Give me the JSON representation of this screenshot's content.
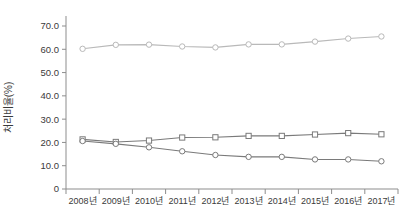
{
  "chart_data": {
    "type": "line",
    "title": "",
    "xlabel": "",
    "ylabel": "처리비율(%)",
    "categories": [
      "2008년",
      "2009년",
      "2010년",
      "2011년",
      "2012년",
      "2013년",
      "2014년",
      "2015년",
      "2016년",
      "2017년"
    ],
    "ylim": [
      0,
      75
    ],
    "yticks": [
      0,
      10,
      20,
      30,
      40,
      50,
      60,
      70
    ],
    "ytick_labels": [
      "0",
      "10.0",
      "20.0",
      "30.0",
      "40.0",
      "50.0",
      "60.0",
      "70.0"
    ],
    "grid": false,
    "legend": "none",
    "series": [
      {
        "name": "series-1",
        "marker": "circle",
        "color": "#b9b9b9",
        "values": [
          60.2,
          61.9,
          62.0,
          61.2,
          60.8,
          62.1,
          62.1,
          63.3,
          64.6,
          65.5
        ]
      },
      {
        "name": "series-2",
        "marker": "square",
        "color": "#7a7a7a",
        "values": [
          21.3,
          20.2,
          20.8,
          22.1,
          22.2,
          22.8,
          22.8,
          23.4,
          24.0,
          23.5
        ]
      },
      {
        "name": "series-3",
        "marker": "circle",
        "color": "#7a7a7a",
        "values": [
          20.6,
          19.4,
          17.9,
          16.2,
          14.6,
          13.8,
          13.8,
          12.7,
          12.7,
          11.9
        ]
      }
    ]
  },
  "axes": {
    "y_title": "처리비율(%)",
    "y_tick_labels": [
      "70.0",
      "60.0",
      "50.0",
      "40.0",
      "30.0",
      "20.0",
      "10.0",
      "0"
    ],
    "x_tick_labels": [
      "2008년",
      "2009년",
      "2010년",
      "2011년",
      "2012년",
      "2013년",
      "2014년",
      "2015년",
      "2016년",
      "2017년"
    ]
  }
}
